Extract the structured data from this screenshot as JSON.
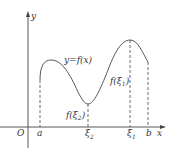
{
  "diagram": {
    "type": "function-graph",
    "axes": {
      "x_label": "x",
      "y_label": "y",
      "origin_label": "O"
    },
    "curve_label": "y=f(x)",
    "x_ticks": [
      {
        "label": "a",
        "sub": ""
      },
      {
        "label": "ξ",
        "sub": "2"
      },
      {
        "label": "ξ",
        "sub": "1"
      },
      {
        "label": "b",
        "sub": ""
      }
    ],
    "point_labels": {
      "f_xi1": {
        "pre": "f(ξ",
        "sub": "1",
        "post": ")"
      },
      "f_xi2": {
        "pre": "f(ξ",
        "sub": "2",
        "post": ")"
      }
    },
    "colors": {
      "line": "#444444",
      "text": "#333333",
      "background": "#ffffff"
    }
  }
}
